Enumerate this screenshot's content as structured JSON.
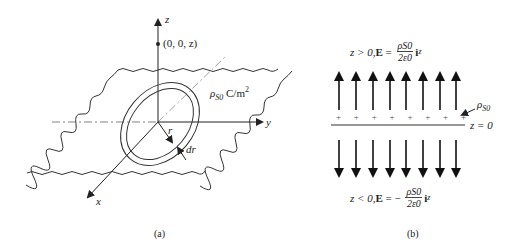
{
  "panel_a": {
    "caption": "(a)",
    "axis_z": "z",
    "axis_y": "y",
    "axis_x": "x",
    "point_label": "(0, 0, z)",
    "charge_density_symbol": "ρ",
    "charge_density_sub": "S0",
    "charge_density_units": "C/m",
    "charge_density_units_exp": "2",
    "radius_label": "r",
    "ring_width_label": "dr"
  },
  "panel_b": {
    "caption": "(b)",
    "upper_condition": "z > 0, ",
    "upper_field": "E",
    "upper_eq": " = ",
    "upper_num": "ρS0",
    "upper_den": "2ε0",
    "upper_unit": "i",
    "upper_unit_sub": "z",
    "lower_condition": "z < 0, ",
    "lower_field": "E",
    "lower_eq": " = − ",
    "lower_num": "ρS0",
    "lower_den": "2ε0",
    "lower_unit": "i",
    "lower_unit_sub": "z",
    "sheet_label_symbol": "ρ",
    "sheet_label_sub": "S0",
    "plane_label": "z = 0",
    "plus_signs": [
      "+",
      "+",
      "+",
      "+",
      "+",
      "+",
      "+",
      "+"
    ],
    "arrow_count": 8
  }
}
